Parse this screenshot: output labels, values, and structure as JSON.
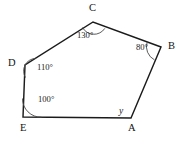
{
  "figure": {
    "type": "polygon-angles-diagram",
    "shape_name": "pentagon",
    "background_color": "#ffffff",
    "stroke_color": "#1b1b1b",
    "arc_color": "#4a4a4a",
    "canvas": {
      "width": 187,
      "height": 142
    },
    "vertices": [
      {
        "id": "A",
        "label": "A",
        "x": 131,
        "y": 118,
        "label_x": 128,
        "label_y": 123
      },
      {
        "id": "B",
        "label": "B",
        "x": 161,
        "y": 47,
        "label_x": 168,
        "label_y": 41
      },
      {
        "id": "C",
        "label": "C",
        "x": 93,
        "y": 22,
        "label_x": 89,
        "label_y": 3
      },
      {
        "id": "D",
        "label": "D",
        "x": 25,
        "y": 65,
        "label_x": 8,
        "label_y": 58
      },
      {
        "id": "E",
        "label": "E",
        "x": 23,
        "y": 117,
        "label_x": 20,
        "label_y": 123
      }
    ],
    "angles": [
      {
        "at": "C",
        "value": "130",
        "unit": "°",
        "text": "130°",
        "known": true,
        "label_x": 77,
        "label_y": 31
      },
      {
        "at": "B",
        "value": "80",
        "unit": "°",
        "text": "80°",
        "known": true,
        "label_x": 136,
        "label_y": 43
      },
      {
        "at": "D",
        "value": "110",
        "unit": "°",
        "text": "110°",
        "known": true,
        "label_x": 37,
        "label_y": 63
      },
      {
        "at": "E",
        "value": "100",
        "unit": "°",
        "text": "100°",
        "known": true,
        "label_x": 38,
        "label_y": 95
      },
      {
        "at": "A",
        "value": "y",
        "unit": "",
        "text": "y",
        "known": false,
        "label_x": 119,
        "label_y": 107
      }
    ],
    "edges": [
      {
        "from": "A",
        "to": "B"
      },
      {
        "from": "B",
        "to": "C"
      },
      {
        "from": "C",
        "to": "D"
      },
      {
        "from": "D",
        "to": "E"
      },
      {
        "from": "E",
        "to": "A"
      }
    ]
  }
}
